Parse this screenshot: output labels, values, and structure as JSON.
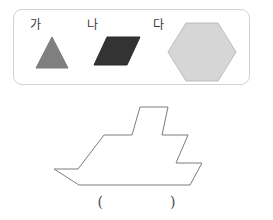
{
  "page": {
    "width": 273,
    "height": 220,
    "background": "#ffffff"
  },
  "shape_panel": {
    "border_color": "#d2d2d2",
    "items": [
      {
        "label": "가",
        "shape": "triangle",
        "icon_name": "triangle-shape",
        "fill": "#808080",
        "stroke": "#7a7a7a"
      },
      {
        "label": "나",
        "shape": "parallelogram",
        "icon_name": "parallelogram-shape",
        "fill": "#333333",
        "stroke": "#2b2b2b"
      },
      {
        "label": "다",
        "shape": "hexagon",
        "icon_name": "hexagon-shape",
        "fill": "#d6d6d6",
        "stroke": "#bcbcbc"
      }
    ]
  },
  "figure": {
    "name": "boat-outline",
    "stroke": "#7c7c7c",
    "fill": "#ffffff",
    "stroke_width": 1
  },
  "answer": {
    "open_paren": "(",
    "close_paren": ")",
    "value": ""
  }
}
